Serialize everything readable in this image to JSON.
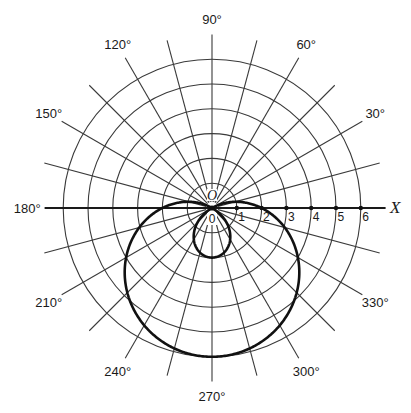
{
  "chart_data": {
    "type": "line",
    "coordinate_system": "polar",
    "title": "",
    "equation": "r = 2 - 4 sin θ",
    "curve_description": "Limaçon with inner loop",
    "angle_unit": "degrees",
    "angle_grid_step": 15,
    "angle_labels": [
      {
        "angle": 0,
        "text": "X"
      },
      {
        "angle": 30,
        "text": "30°"
      },
      {
        "angle": 60,
        "text": "60°"
      },
      {
        "angle": 90,
        "text": "90°"
      },
      {
        "angle": 120,
        "text": "120°"
      },
      {
        "angle": 150,
        "text": "150°"
      },
      {
        "angle": 180,
        "text": "180°"
      },
      {
        "angle": 210,
        "text": "210°"
      },
      {
        "angle": 240,
        "text": "240°"
      },
      {
        "angle": 270,
        "text": "270°"
      },
      {
        "angle": 300,
        "text": "300°"
      },
      {
        "angle": 330,
        "text": "330°"
      }
    ],
    "radial_rings": [
      1,
      2,
      3,
      4,
      5,
      6
    ],
    "rlim": [
      0,
      6
    ],
    "radial_tick_labels": [
      "0",
      "1",
      "2",
      "3",
      "4",
      "5",
      "6"
    ],
    "pole_label": "O",
    "polar_axis_label": "X",
    "grid": true,
    "legend": null,
    "series": [
      {
        "name": "r = 2 - 4 sin θ",
        "theta_deg": [
          0,
          30,
          60,
          90,
          120,
          150,
          180,
          210,
          240,
          270,
          300,
          330,
          360
        ],
        "r": [
          2,
          0,
          -1.464,
          -2,
          -1.464,
          0,
          2,
          4,
          5.464,
          6,
          5.464,
          4,
          2
        ]
      }
    ]
  },
  "layout": {
    "center": [
      212,
      208
    ],
    "unit_px": 24.8,
    "radial_line_extent": 7.0,
    "label_radius": 7.6
  }
}
